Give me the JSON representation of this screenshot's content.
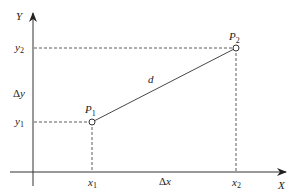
{
  "diagram": {
    "title": "",
    "axes": {
      "x_label": "X",
      "y_label": "Y"
    },
    "points": [
      {
        "name": "P",
        "sub": "1"
      },
      {
        "name": "P",
        "sub": "2"
      }
    ],
    "x_ticks": [
      {
        "name": "x",
        "sub": "1"
      },
      {
        "name": "x",
        "sub": "2"
      }
    ],
    "y_ticks": [
      {
        "name": "y",
        "sub": "1"
      },
      {
        "name": "y",
        "sub": "2"
      }
    ],
    "delta_x": {
      "delta": "Δ",
      "var": "x"
    },
    "delta_y": {
      "delta": "Δ",
      "var": "y"
    },
    "distance_label": "d",
    "colors": {
      "line": "#333333",
      "background": "#ffffff"
    }
  }
}
